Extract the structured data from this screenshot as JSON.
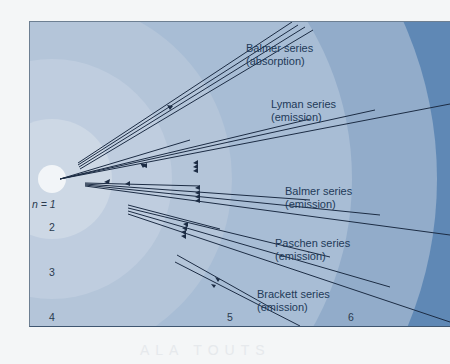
{
  "diagram": {
    "levels": [
      {
        "label": "n = 1",
        "n": 1
      },
      {
        "label": "2",
        "n": 2
      },
      {
        "label": "3",
        "n": 3
      },
      {
        "label": "4",
        "n": 4
      },
      {
        "label": "5",
        "n": 5
      },
      {
        "label": "6",
        "n": 6
      }
    ],
    "series": [
      {
        "name": "Balmer series",
        "type": "(absorption)"
      },
      {
        "name": "Lyman series",
        "type": "(emission)"
      },
      {
        "name": "Balmer series",
        "type": "(emission)"
      },
      {
        "name": "Paschen series",
        "type": "(emission)"
      },
      {
        "name": "Brackett series",
        "type": "(emission)"
      }
    ],
    "colors": {
      "ring1": "#eef2f6",
      "ring2": "#c6d3e2",
      "ring3": "#b5c6da",
      "ring4": "#a8bdd5",
      "ring5": "#92acca",
      "ring6": "#5f88b5",
      "line": "#1c2c44"
    },
    "watermark": "ALA TOUTS"
  }
}
